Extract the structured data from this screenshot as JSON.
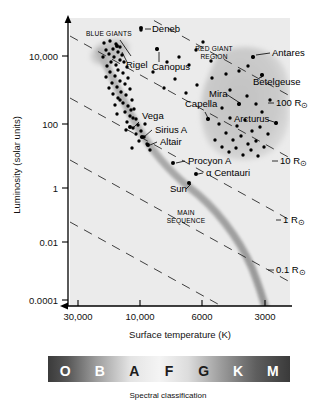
{
  "figure": {
    "type": "hr-diagram",
    "background": "#ffffff",
    "plot_background": "#ebebeb",
    "blob_color": "#c9c9c9",
    "curve_color": "#a8a8a8"
  },
  "axes": {
    "y": {
      "label": "Luminosity (solar units)",
      "ticks": [
        "10,000",
        "100",
        "1",
        "0.01",
        "0.0001"
      ],
      "tick_pix_y": [
        56,
        124,
        188,
        242,
        300
      ]
    },
    "x": {
      "label": "Surface temperature (K)",
      "ticks": [
        "30,000",
        "10,000",
        "6000",
        "3000"
      ],
      "tick_pix_x": [
        78,
        140,
        202,
        265
      ]
    }
  },
  "spectral": {
    "caption": "Spectral classification",
    "classes": [
      "O",
      "B",
      "A",
      "F",
      "G",
      "K",
      "M"
    ]
  },
  "regions": [
    {
      "name": "blue-giants",
      "label": "BLUE GIANTS",
      "label_x": 86,
      "label_y": 36
    },
    {
      "name": "red-giant-region",
      "label_line1": "RED GIANT",
      "label_line2": "REGION",
      "label_x": 214,
      "label_y": 51
    },
    {
      "name": "main-sequence",
      "label_line1": "MAIN",
      "label_line2": "SEQUENCE",
      "label_x": 186,
      "label_y": 215
    }
  ],
  "radius_lines": [
    {
      "label": "100 R",
      "sub": "⊙",
      "x": 276,
      "y": 106
    },
    {
      "label": "10 R",
      "sub": "⊙",
      "x": 280,
      "y": 164
    },
    {
      "label": "1 R",
      "sub": "⊙",
      "x": 283,
      "y": 223
    },
    {
      "label": "0.1 R",
      "sub": "⊙",
      "x": 276,
      "y": 273
    }
  ],
  "stars": [
    {
      "label": "Deneb",
      "text_x": 152,
      "text_y": 32,
      "dot_x": 141,
      "dot_y": 28,
      "anchor": "start"
    },
    {
      "label": "Rigel",
      "text_x": 126,
      "text_y": 68,
      "dot_x": 117,
      "dot_y": 46,
      "anchor": "start"
    },
    {
      "label": "Canopus",
      "text_x": 152,
      "text_y": 70,
      "dot_x": 157,
      "dot_y": 49,
      "anchor": "start"
    },
    {
      "label": "Antares",
      "text_x": 272,
      "text_y": 56,
      "dot_x": 253,
      "dot_y": 57,
      "anchor": "start"
    },
    {
      "label": "Betelgeuse",
      "text_x": 253,
      "text_y": 85,
      "dot_x": 262,
      "dot_y": 75,
      "anchor": "start"
    },
    {
      "label": "Mira",
      "text_x": 209,
      "text_y": 97,
      "dot_x": 239,
      "dot_y": 104,
      "anchor": "start"
    },
    {
      "label": "Capella",
      "text_x": 185,
      "text_y": 107,
      "dot_x": 208,
      "dot_y": 119,
      "anchor": "start"
    },
    {
      "label": "Arcturus",
      "text_x": 234,
      "text_y": 122,
      "dot_x": 276,
      "dot_y": 123,
      "anchor": "start"
    },
    {
      "label": "Vega",
      "text_x": 142,
      "text_y": 119,
      "dot_x": 130,
      "dot_y": 127,
      "anchor": "start"
    },
    {
      "label": "Sirius A",
      "text_x": 155,
      "text_y": 133,
      "dot_x": 142,
      "dot_y": 137,
      "anchor": "start"
    },
    {
      "label": "Altair",
      "text_x": 160,
      "text_y": 145,
      "dot_x": 148,
      "dot_y": 145,
      "anchor": "start"
    },
    {
      "label": "Procyon A",
      "text_x": 188,
      "text_y": 164,
      "dot_x": 173,
      "dot_y": 163,
      "anchor": "start"
    },
    {
      "label": "α Centauri",
      "text_x": 206,
      "text_y": 176,
      "dot_x": 196,
      "dot_y": 174,
      "anchor": "start"
    },
    {
      "label": "Sun",
      "text_x": 170,
      "text_y": 192,
      "dot_x": 189,
      "dot_y": 183,
      "anchor": "start"
    }
  ],
  "chart_data": {
    "type": "scatter",
    "xlabel": "Surface temperature (K)",
    "ylabel": "Luminosity (solar units)",
    "x_scale": "log-reversed",
    "y_scale": "log",
    "xlim": [
      30000,
      2500
    ],
    "ylim": [
      0.0001,
      100000
    ],
    "xticks": [
      30000,
      10000,
      6000,
      3000
    ],
    "yticks": [
      10000,
      100,
      1,
      0.01,
      0.0001
    ],
    "grid": false,
    "legend": false,
    "annotations": [
      "BLUE GIANTS",
      "RED GIANT REGION",
      "MAIN SEQUENCE"
    ],
    "radius_isolines": [
      "100 R⊙",
      "10 R⊙",
      "1 R⊙",
      "0.1 R⊙"
    ],
    "spectral_classes": [
      "O",
      "B",
      "A",
      "F",
      "G",
      "K",
      "M"
    ],
    "named_stars": [
      {
        "name": "Deneb",
        "temperature_K": 8500,
        "luminosity_Lsun": 100000
      },
      {
        "name": "Rigel",
        "temperature_K": 12000,
        "luminosity_Lsun": 40000
      },
      {
        "name": "Canopus",
        "temperature_K": 7400,
        "luminosity_Lsun": 15000
      },
      {
        "name": "Antares",
        "temperature_K": 3400,
        "luminosity_Lsun": 10000
      },
      {
        "name": "Betelgeuse",
        "temperature_K": 3100,
        "luminosity_Lsun": 4000
      },
      {
        "name": "Mira",
        "temperature_K": 3200,
        "luminosity_Lsun": 600
      },
      {
        "name": "Capella",
        "temperature_K": 5000,
        "luminosity_Lsun": 130
      },
      {
        "name": "Arcturus",
        "temperature_K": 4300,
        "luminosity_Lsun": 110
      },
      {
        "name": "Vega",
        "temperature_K": 9600,
        "luminosity_Lsun": 50
      },
      {
        "name": "Sirius A",
        "temperature_K": 9900,
        "luminosity_Lsun": 25
      },
      {
        "name": "Altair",
        "temperature_K": 7500,
        "luminosity_Lsun": 11
      },
      {
        "name": "Procyon A",
        "temperature_K": 6500,
        "luminosity_Lsun": 7
      },
      {
        "name": "α Centauri",
        "temperature_K": 5800,
        "luminosity_Lsun": 1.5
      },
      {
        "name": "Sun",
        "temperature_K": 5800,
        "luminosity_Lsun": 1
      }
    ],
    "scatter_points_pixel": [
      [
        104,
        43
      ],
      [
        110,
        41
      ],
      [
        116,
        44
      ],
      [
        120,
        47
      ],
      [
        113,
        49
      ],
      [
        106,
        50
      ],
      [
        118,
        52
      ],
      [
        109,
        54
      ],
      [
        122,
        55
      ],
      [
        114,
        57
      ],
      [
        103,
        57
      ],
      [
        120,
        60
      ],
      [
        111,
        62
      ],
      [
        124,
        62
      ],
      [
        116,
        65
      ],
      [
        107,
        66
      ],
      [
        127,
        67
      ],
      [
        118,
        70
      ],
      [
        110,
        72
      ],
      [
        123,
        73
      ],
      [
        115,
        76
      ],
      [
        106,
        77
      ],
      [
        128,
        78
      ],
      [
        120,
        81
      ],
      [
        112,
        83
      ],
      [
        125,
        84
      ],
      [
        117,
        87
      ],
      [
        109,
        88
      ],
      [
        130,
        89
      ],
      [
        121,
        92
      ],
      [
        113,
        94
      ],
      [
        126,
        95
      ],
      [
        118,
        98
      ],
      [
        132,
        100
      ],
      [
        123,
        103
      ],
      [
        115,
        105
      ],
      [
        128,
        106
      ],
      [
        134,
        109
      ],
      [
        125,
        112
      ],
      [
        117,
        114
      ],
      [
        130,
        116
      ],
      [
        136,
        119
      ],
      [
        127,
        122
      ],
      [
        138,
        125
      ],
      [
        133,
        128
      ],
      [
        141,
        131
      ],
      [
        136,
        134
      ],
      [
        144,
        137
      ],
      [
        139,
        141
      ],
      [
        147,
        144
      ],
      [
        132,
        148
      ],
      [
        150,
        150
      ],
      [
        141,
        30
      ],
      [
        157,
        49
      ],
      [
        167,
        62
      ],
      [
        179,
        57
      ],
      [
        189,
        65
      ],
      [
        196,
        50
      ],
      [
        203,
        42
      ],
      [
        211,
        61
      ],
      [
        212,
        78
      ],
      [
        226,
        74
      ],
      [
        239,
        71
      ],
      [
        248,
        66
      ],
      [
        253,
        57
      ],
      [
        262,
        75
      ],
      [
        230,
        90
      ],
      [
        239,
        104
      ],
      [
        247,
        96
      ],
      [
        256,
        104
      ],
      [
        262,
        112
      ],
      [
        270,
        100
      ],
      [
        276,
        123
      ],
      [
        222,
        108
      ],
      [
        230,
        118
      ],
      [
        237,
        126
      ],
      [
        245,
        120
      ],
      [
        252,
        131
      ],
      [
        260,
        127
      ],
      [
        268,
        134
      ],
      [
        219,
        124
      ],
      [
        226,
        133
      ],
      [
        233,
        140
      ],
      [
        241,
        136
      ],
      [
        248,
        144
      ],
      [
        256,
        141
      ],
      [
        264,
        147
      ],
      [
        215,
        140
      ],
      [
        222,
        147
      ],
      [
        229,
        152
      ],
      [
        236,
        148
      ],
      [
        243,
        155
      ],
      [
        251,
        150
      ],
      [
        258,
        156
      ],
      [
        208,
        119
      ],
      [
        197,
        85
      ],
      [
        186,
        93
      ],
      [
        175,
        79
      ],
      [
        164,
        88
      ],
      [
        153,
        72
      ],
      [
        131,
        110
      ],
      [
        120,
        100
      ],
      [
        126,
        130
      ],
      [
        133,
        118
      ],
      [
        145,
        124
      ]
    ]
  }
}
